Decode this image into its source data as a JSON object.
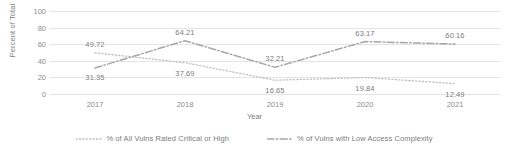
{
  "chart_data": {
    "type": "line",
    "title": "",
    "xlabel": "Year",
    "ylabel": "Percent of Total",
    "categories": [
      "2017",
      "2018",
      "2019",
      "2020",
      "2021"
    ],
    "x": [
      2017,
      2018,
      2019,
      2020,
      2021
    ],
    "ylim": [
      0,
      100
    ],
    "yticks": [
      0,
      20,
      40,
      60,
      80,
      100
    ],
    "ytick_labels": [
      "0",
      "20",
      "40",
      "60",
      "80",
      "100"
    ],
    "grid": true,
    "legend_position": "bottom",
    "series": [
      {
        "name": "% of All Vulns Rated Critical or High",
        "style": "dotted",
        "color": "#bfbfbf",
        "values": [
          49.72,
          37.69,
          16.65,
          19.84,
          12.49
        ],
        "labels": [
          "49.72",
          "37.69",
          "16.65",
          "19.84",
          "12.49"
        ]
      },
      {
        "name": "% of Vulns with Low Access Complexity",
        "style": "dash-dot",
        "color": "#a6a6a6",
        "values": [
          31.35,
          64.21,
          32.21,
          63.17,
          60.16
        ],
        "labels": [
          "31.35",
          "64.21",
          "32.21",
          "63.17",
          "60.16"
        ]
      }
    ]
  },
  "legend": {
    "items": [
      {
        "label": "% of All Vulns Rated Critical or High"
      },
      {
        "label": "% of Vulns with Low Access Complexity"
      }
    ]
  },
  "axes": {
    "y_title": "Percent of Total",
    "x_title": "Year"
  },
  "colors": {
    "gridline": "#e4e4e4",
    "text": "#808080",
    "series_critical_high": "#bfbfbf",
    "series_low_access_complexity": "#a6a6a6",
    "background": "#ffffff"
  }
}
